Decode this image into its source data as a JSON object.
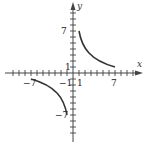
{
  "diagram": {
    "type": "function-graph",
    "function": "y = 7/x",
    "axes": {
      "x_label": "x",
      "y_label": "y",
      "x_tick_labels": [
        "-7",
        "-1",
        "1",
        "7"
      ],
      "y_tick_labels": [
        "7",
        "1",
        "-7"
      ],
      "labels": {
        "x_neg7": "−7",
        "x_neg1": "−1",
        "x_pos1": "1",
        "x_pos7": "7",
        "y_pos7": "7",
        "y_pos1": "1",
        "y_neg7": "−7"
      }
    },
    "branches": [
      {
        "name": "first-quadrant",
        "domain": [
          1,
          7
        ],
        "endpoints": [
          [
            1,
            7
          ],
          [
            7,
            1
          ]
        ]
      },
      {
        "name": "third-quadrant",
        "domain": [
          -7,
          -1
        ],
        "endpoints": [
          [
            -7,
            -1
          ],
          [
            -1,
            -7
          ]
        ]
      }
    ],
    "colors": {
      "curve": "#333333",
      "axis": "#444444"
    }
  }
}
